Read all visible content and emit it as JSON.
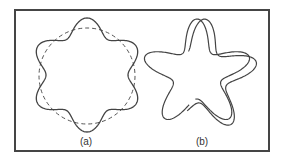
{
  "figure": {
    "colors": {
      "stroke": "#444444",
      "frame": "#454545",
      "background": "#ffffff"
    },
    "panels": [
      {
        "id": "a",
        "label": "(a)",
        "label_pos": [
          86,
          137
        ],
        "description": "Six-lobed wavy closed curve overlaid on a dashed reference circle",
        "reference_circle": {
          "cx": 87,
          "cy": 76,
          "r": 48,
          "style": "dashed"
        },
        "wavy_curve": {
          "cx": 87,
          "cy": 75,
          "r": 49,
          "amplitude": 8,
          "lobes": 6,
          "phase_deg": -90
        }
      },
      {
        "id": "b",
        "label": "(b)",
        "label_pos": [
          202,
          137
        ],
        "description": "Five-pointed wavy star drawn as two overlapping, slightly offset open strokes",
        "star_curve": {
          "cx": 197,
          "cy": 74,
          "r": 38,
          "amplitude": 15,
          "points": 5,
          "phase_deg": -90
        },
        "offset_curve": {
          "dx": 4,
          "dy": 2,
          "rotate_deg": 4
        }
      }
    ]
  }
}
